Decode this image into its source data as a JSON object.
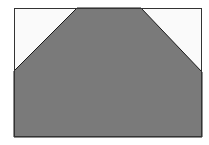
{
  "figure": {
    "type": "shape-diagram",
    "frame": {
      "x": 14,
      "y": 8,
      "width": 188,
      "height": 129,
      "stroke": "#333333",
      "fill": "#fafafa"
    },
    "shape": {
      "kind": "polygon",
      "description": "gray region with both top corners cut off diagonally",
      "fill": "#7a7a7a",
      "stroke": "#1a1a1a",
      "points": [
        [
          14,
          71
        ],
        [
          77,
          8
        ],
        [
          141,
          8
        ],
        [
          202,
          72
        ],
        [
          202,
          137
        ],
        [
          14,
          137
        ]
      ]
    },
    "corner_cutouts": [
      {
        "name": "top-left",
        "fill": "#fafafa",
        "points": [
          [
            14,
            8
          ],
          [
            77,
            8
          ],
          [
            14,
            71
          ]
        ]
      },
      {
        "name": "top-right",
        "fill": "#fafafa",
        "points": [
          [
            141,
            8
          ],
          [
            202,
            8
          ],
          [
            202,
            72
          ]
        ]
      }
    ]
  }
}
